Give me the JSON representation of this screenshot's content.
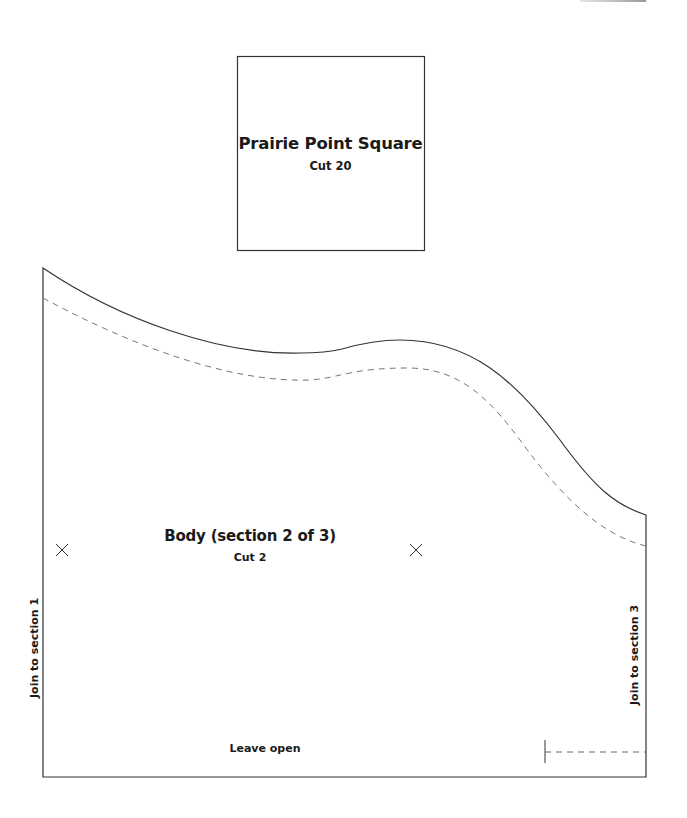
{
  "pattern": {
    "prairie_square": {
      "title": "Prairie Point Square",
      "cut": "Cut 20"
    },
    "body_piece": {
      "title": "Body (section 2 of 3)",
      "cut": "Cut 2",
      "left_edge_label": "Join to section 1",
      "right_edge_label": "Join to section 3",
      "bottom_label": "Leave open",
      "markers": [
        "x-mark",
        "x-mark"
      ]
    }
  },
  "colors": {
    "line": "#333333",
    "dashed_line": "#777777",
    "background": "#ffffff"
  }
}
